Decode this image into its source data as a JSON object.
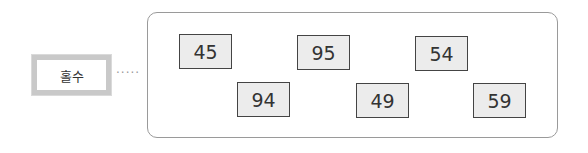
{
  "label": {
    "text": "홀수",
    "connector": "·····"
  },
  "numbers": [
    {
      "value": "45",
      "left": 179,
      "top": 34
    },
    {
      "value": "95",
      "left": 297,
      "top": 35
    },
    {
      "value": "54",
      "left": 415,
      "top": 36
    },
    {
      "value": "94",
      "left": 237,
      "top": 82
    },
    {
      "value": "49",
      "left": 356,
      "top": 83
    },
    {
      "value": "59",
      "left": 473,
      "top": 83
    }
  ]
}
